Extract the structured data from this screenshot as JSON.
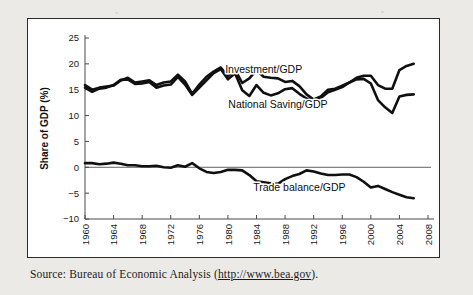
{
  "figure": {
    "source_prefix": "Source: Bureau of Economic Analysis (",
    "source_url": "http://www.bea.gov",
    "source_suffix": ")."
  },
  "chart_data": {
    "type": "line",
    "title": "",
    "xlabel": "Year",
    "ylabel": "Share of GDP (%)",
    "xlim": [
      1960,
      2008
    ],
    "ylim": [
      -10,
      25
    ],
    "xticks": [
      1960,
      1964,
      1968,
      1972,
      1976,
      1980,
      1984,
      1988,
      1992,
      1996,
      2000,
      2004,
      2008
    ],
    "xtick_labels": [
      "1960",
      "1964",
      "1968",
      "1972",
      "1976",
      "1980",
      "1984",
      "1988",
      "1992",
      "1996",
      "2000",
      "2004",
      "2008"
    ],
    "yticks": [
      -10,
      -5,
      0,
      5,
      10,
      15,
      20,
      25
    ],
    "ytick_labels": [
      "−10",
      "−5",
      "0",
      "5",
      "10",
      "15",
      "20",
      "25"
    ],
    "grid": false,
    "legend": "inline-annotations",
    "zero_reference_line": true,
    "line_color": "#101010",
    "axis_color": "#4a4a4a",
    "x": [
      1960,
      1961,
      1962,
      1963,
      1964,
      1965,
      1966,
      1967,
      1968,
      1969,
      1970,
      1971,
      1972,
      1973,
      1974,
      1975,
      1976,
      1977,
      1978,
      1979,
      1980,
      1981,
      1982,
      1983,
      1984,
      1985,
      1986,
      1987,
      1988,
      1989,
      1990,
      1991,
      1992,
      1993,
      1994,
      1995,
      1996,
      1997,
      1998,
      1999,
      2000,
      2001,
      2002,
      2003,
      2004,
      2005,
      2006
    ],
    "series": [
      {
        "name": "Investment/GDP",
        "label": "Investment/GDP",
        "label_x": 1985.0,
        "label_y": 18.3,
        "values": [
          15.9,
          15.0,
          15.4,
          15.6,
          15.8,
          16.8,
          17.3,
          16.4,
          16.6,
          16.8,
          15.9,
          16.4,
          16.6,
          17.9,
          16.6,
          14.2,
          16.0,
          17.5,
          18.5,
          19.3,
          17.6,
          18.9,
          16.3,
          17.2,
          18.8,
          17.5,
          17.3,
          17.2,
          16.5,
          16.7,
          15.7,
          14.1,
          13.1,
          13.7,
          15.0,
          15.2,
          15.8,
          16.4,
          17.3,
          17.7,
          17.7,
          15.9,
          15.2,
          15.2,
          18.8,
          19.6,
          20.0
        ]
      },
      {
        "name": "National Saving/GDP",
        "label": "National Saving/GDP",
        "label_x": 1987.0,
        "label_y": 11.4,
        "values": [
          15.4,
          14.6,
          15.2,
          15.4,
          15.9,
          16.9,
          17.0,
          16.1,
          16.2,
          16.5,
          15.4,
          15.8,
          16.0,
          17.5,
          16.0,
          14.0,
          15.4,
          16.8,
          18.2,
          19.0,
          17.0,
          18.2,
          14.9,
          13.8,
          15.9,
          14.4,
          13.9,
          14.3,
          15.1,
          15.3,
          14.2,
          13.3,
          13.0,
          13.4,
          14.5,
          15.0,
          15.5,
          16.4,
          17.0,
          17.1,
          16.2,
          13.0,
          11.6,
          10.5,
          13.7,
          14.0,
          14.1
        ]
      },
      {
        "name": "Trade balance/GDP",
        "label": "Trade balance/GDP",
        "label_x": 1990.0,
        "label_y": -4.5,
        "values": [
          0.8,
          0.8,
          0.6,
          0.7,
          0.9,
          0.7,
          0.4,
          0.4,
          0.2,
          0.2,
          0.3,
          0.0,
          -0.1,
          0.4,
          0.1,
          0.8,
          -0.2,
          -0.9,
          -1.1,
          -0.9,
          -0.5,
          -0.5,
          -0.6,
          -1.5,
          -2.7,
          -2.9,
          -3.1,
          -3.2,
          -2.3,
          -1.7,
          -1.3,
          -0.6,
          -0.8,
          -1.2,
          -1.5,
          -1.5,
          -1.4,
          -1.4,
          -1.9,
          -2.8,
          -3.9,
          -3.6,
          -4.2,
          -4.8,
          -5.3,
          -5.8,
          -6.0
        ]
      }
    ]
  }
}
